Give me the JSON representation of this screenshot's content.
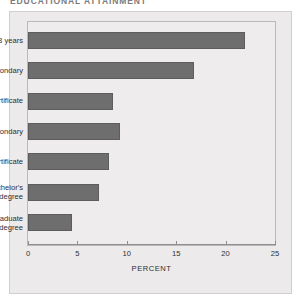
{
  "figure": {
    "title": "EDUCATIONAL ATTAINMENT",
    "panel_color": "#eceaea",
    "bar_color": "#6e6e6e"
  },
  "chart_data": {
    "type": "bar",
    "orientation": "horizontal",
    "title": "EDUCATIONAL ATTAINMENT",
    "xlabel": "PERCENT",
    "ylabel": "",
    "xlim": [
      0,
      25
    ],
    "xticks": [
      0,
      5,
      10,
      15,
      20,
      25
    ],
    "xticklabels": [
      "0",
      "5",
      "10",
      "15",
      "20",
      "25"
    ],
    "grid": false,
    "legend": false,
    "categories": [
      "0–8 years",
      "Some secondary",
      "High school certificate",
      "Some postsecondary",
      "Postsecondary certificate",
      "University: bachelor's\ndegree",
      "University: postgraduate\ndegree"
    ],
    "values": [
      22.0,
      16.8,
      8.6,
      9.3,
      8.2,
      7.2,
      4.5
    ]
  }
}
